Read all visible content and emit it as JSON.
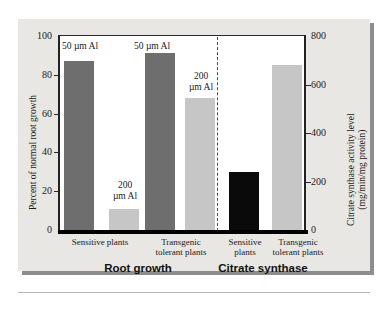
{
  "figure": {
    "background_color": "#e8e7e3",
    "plot_background_color": "#ffffff"
  },
  "chart_data": {
    "type": "bar",
    "title": "",
    "subtitle": "",
    "xlabel": "",
    "ylabel": "Percent of normal root growth",
    "y2label": "Citrate synthase activity level (mg/min/mg protein)",
    "y2label_line1": "Citrate synthase activity level",
    "y2label_line2": "(mg/min/mg protein)",
    "ylim": [
      0,
      100
    ],
    "y2lim": [
      0,
      800
    ],
    "yticks": [
      0,
      20,
      40,
      60,
      80,
      100
    ],
    "y2ticks": [
      0,
      200,
      400,
      600,
      800
    ],
    "grid": false,
    "legend": "none",
    "panel_divider": "dashed",
    "panels": [
      {
        "name": "Root growth",
        "axis": "left",
        "bars": [
          {
            "category": "Sensitive plants",
            "category_line1": "Sensitive plants",
            "category_line2": "",
            "annotation": "50 µm Al",
            "annotation_line1": "50 µm Al",
            "annotation_line2": "",
            "value": 87,
            "color": "#6e6e6e",
            "color_name": "dark-gray"
          },
          {
            "category": "Sensitive plants",
            "category_line1": "",
            "category_line2": "",
            "annotation": "200 µm Al",
            "annotation_line1": "200",
            "annotation_line2": "µm Al",
            "value": 11,
            "color": "#c6c6c6",
            "color_name": "light-gray"
          },
          {
            "category": "Transgenic tolerant plants",
            "category_line1": "Transgenic",
            "category_line2": "tolerant plants",
            "annotation": "50 µm Al",
            "annotation_line1": "50 µm Al",
            "annotation_line2": "",
            "value": 91,
            "color": "#6e6e6e",
            "color_name": "dark-gray"
          },
          {
            "category": "Transgenic tolerant plants",
            "category_line1": "",
            "category_line2": "",
            "annotation": "200 µm Al",
            "annotation_line1": "200",
            "annotation_line2": "µm Al",
            "value": 68,
            "color": "#c6c6c6",
            "color_name": "light-gray"
          }
        ]
      },
      {
        "name": "Citrate synthase",
        "axis": "right",
        "bars": [
          {
            "category": "Sensitive plants",
            "category_line1": "Sensitive",
            "category_line2": "plants",
            "annotation": "",
            "annotation_line1": "",
            "annotation_line2": "",
            "value": 240,
            "color": "#0a0a0a",
            "color_name": "black"
          },
          {
            "category": "Transgenic tolerant plants",
            "category_line1": "Transgenic",
            "category_line2": "tolerant plants",
            "annotation": "",
            "annotation_line1": "",
            "annotation_line2": "",
            "value": 680,
            "color": "#c6c6c6",
            "color_name": "light-gray"
          }
        ]
      }
    ]
  },
  "axis_left": {
    "ticks": [
      "100",
      "80",
      "60",
      "40",
      "20",
      "0"
    ],
    "title": "Percent of normal root growth"
  },
  "axis_right": {
    "ticks": [
      "800",
      "600",
      "400",
      "200",
      "0"
    ],
    "title_line1": "Citrate synthase activity level",
    "title_line2": "(mg/min/mg protein)"
  },
  "group_titles": {
    "left": "Root growth",
    "right": "Citrate synthase"
  }
}
